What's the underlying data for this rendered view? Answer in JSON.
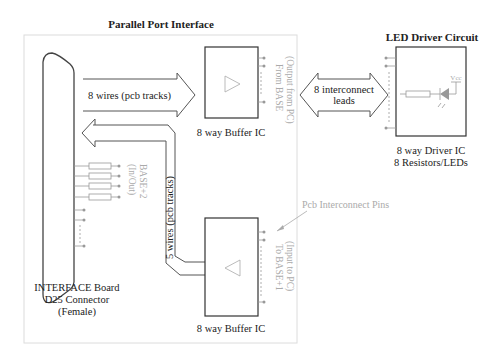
{
  "titles": {
    "parallel_port": "Parallel Port Interface",
    "led_driver": "LED Driver Circuit"
  },
  "arrows": {
    "wires_out": "8 wires (pcb tracks)",
    "wires_in": "5 wires (pcb tracks)",
    "interconnect_line1": "8 interconnect",
    "interconnect_line2": "leads"
  },
  "buffer_top": {
    "label": "8 way Buffer IC",
    "port_line1": "From BASE",
    "port_line2": "(Output from PC)"
  },
  "buffer_bottom": {
    "label": "8 way Buffer IC",
    "port_line1": "To BASE+1",
    "port_line2": "(Input to PC)"
  },
  "connector": {
    "label_line1": "INTERFACE Board",
    "label_line2": "D25 Connector",
    "label_line3": "(Female)",
    "port_line1": "BASE+2",
    "port_line2": "(In/Out)"
  },
  "driver": {
    "label_line1": "8 way Driver IC",
    "label_line2": "8 Resistors/LEDs",
    "vcc": "Vcc"
  },
  "annotation": {
    "pcb_pins": "Pcb Interconnect Pins"
  },
  "colors": {
    "line": "#333333",
    "light": "#aaaaaa",
    "panel": "#dddddd"
  }
}
